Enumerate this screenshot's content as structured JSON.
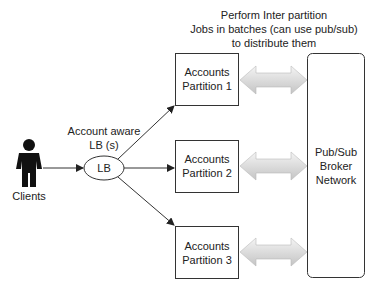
{
  "title_note": [
    "Perform Inter partition",
    "Jobs in batches (can use pub/sub)",
    "to distribute them"
  ],
  "clients": {
    "label": "Clients",
    "icon": "person-icon"
  },
  "lb_caption": [
    "Account aware",
    "LB (s)"
  ],
  "lb": {
    "label": "LB"
  },
  "partitions": [
    {
      "line1": "Accounts",
      "line2": "Partition 1"
    },
    {
      "line1": "Accounts",
      "line2": "Partition 2"
    },
    {
      "line1": "Accounts",
      "line2": "Partition 3"
    }
  ],
  "broker": {
    "lines": [
      "Pub/Sub",
      "Broker",
      "Network"
    ]
  },
  "colors": {
    "stroke": "#333333",
    "arrow_fill_light": "#f2f2f2",
    "arrow_fill_dark": "#c8c8c8"
  }
}
